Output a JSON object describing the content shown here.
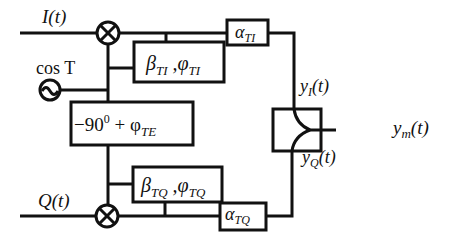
{
  "diagram": {
    "inputs": {
      "in_phase": "I(t)",
      "quadrature": "Q(t)",
      "local_oscillator": "cos T"
    },
    "blocks": {
      "beta_ti": {
        "sym1": "β",
        "sub1": "TI",
        "sep": " ,",
        "sym2": "φ",
        "sub2": "TI"
      },
      "alpha_ti": {
        "sym": "α",
        "sub": "TI"
      },
      "phase_shift": {
        "prefix": "−90",
        "sup": "0",
        "mid": " + φ",
        "sub": "TE"
      },
      "beta_tq": {
        "sym1": "β",
        "sub1": "TQ",
        "sep": " ,",
        "sym2": "φ",
        "sub2": "TQ"
      },
      "alpha_tq": {
        "sym": "α",
        "sub": "TQ"
      }
    },
    "signals": {
      "yi": {
        "base": "y",
        "sub": "I",
        "arg": "(t)"
      },
      "yq": {
        "base": "y",
        "sub": "Q",
        "arg": "(t)"
      },
      "ym": {
        "base": "y",
        "sub": "m",
        "arg": "(t)"
      }
    }
  }
}
